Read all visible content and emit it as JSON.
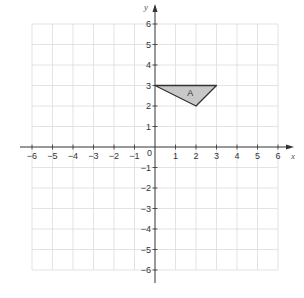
{
  "chart_data": {
    "type": "coordinate-grid",
    "xlabel": "x",
    "ylabel": "y",
    "xlim": [
      -6,
      6
    ],
    "ylim": [
      -6,
      6
    ],
    "grid": true,
    "x_ticks": [
      "-6",
      "-5",
      "-4",
      "-3",
      "-2",
      "-1",
      "1",
      "2",
      "3",
      "4",
      "5",
      "6"
    ],
    "y_ticks": [
      "6",
      "5",
      "4",
      "3",
      "2",
      "1",
      "-1",
      "-2",
      "-3",
      "-4",
      "-5",
      "-6"
    ],
    "origin_label": "0",
    "shapes": [
      {
        "label": "A",
        "type": "triangle",
        "vertices": [
          [
            0,
            3
          ],
          [
            3,
            3
          ],
          [
            2,
            2
          ]
        ],
        "fill": "#c8c8c8",
        "stroke": "#333333"
      }
    ]
  },
  "labels": {
    "x_axis": "x",
    "y_axis": "y",
    "origin": "0",
    "shape_a": "A"
  }
}
